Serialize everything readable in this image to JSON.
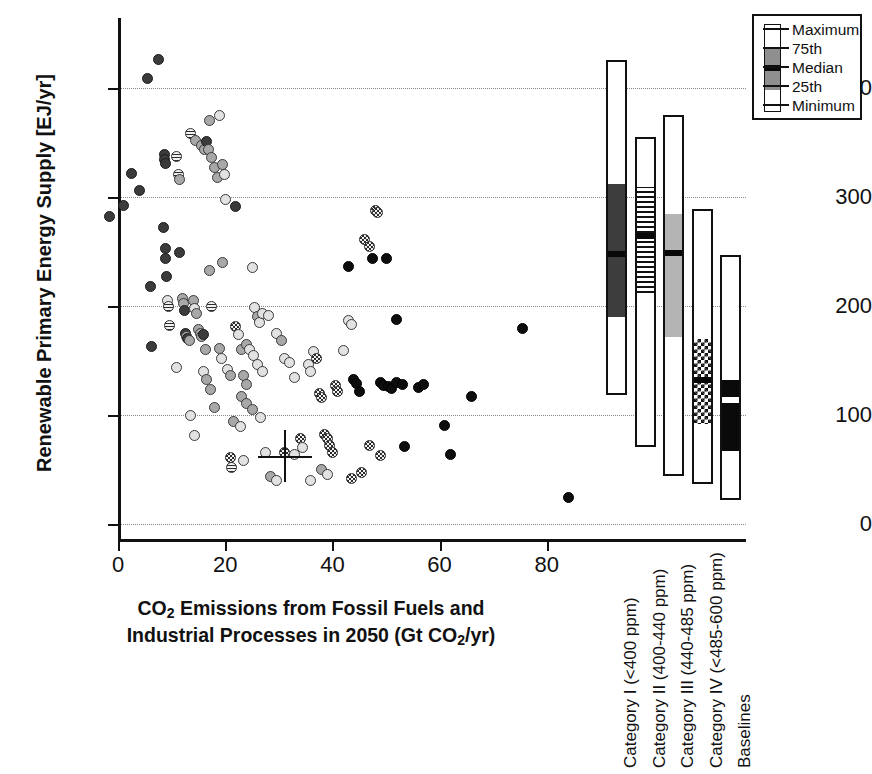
{
  "chart_data": {
    "type": "scatter",
    "title": "",
    "xlabel": "CO2 Emissions from Fossil Fuels and Industrial Processes in 2050 (Gt CO2/yr)",
    "ylabel": "Renewable Primary Energy Supply [EJ/yr]",
    "xlim": [
      -3,
      88
    ],
    "ylim": [
      -15,
      440
    ],
    "xticks": [
      0,
      20,
      40,
      60,
      80
    ],
    "yticks": [
      0,
      100,
      200,
      300,
      400
    ],
    "grid": "horizontal-dotted",
    "legend_position": "top-right",
    "points": [
      {
        "x": -1.5,
        "y": 282,
        "m": "m-dark"
      },
      {
        "x": 1.0,
        "y": 292,
        "m": "m-dark"
      },
      {
        "x": 2.5,
        "y": 322,
        "m": "m-dark"
      },
      {
        "x": 4.0,
        "y": 306,
        "m": "m-dark"
      },
      {
        "x": 5.5,
        "y": 409,
        "m": "m-dark"
      },
      {
        "x": 7.5,
        "y": 426,
        "m": "m-dark"
      },
      {
        "x": 6.0,
        "y": 218,
        "m": "m-dark"
      },
      {
        "x": 6.3,
        "y": 163,
        "m": "m-dark"
      },
      {
        "x": 8.5,
        "y": 272,
        "m": "m-dark"
      },
      {
        "x": 8.8,
        "y": 253,
        "m": "m-dark"
      },
      {
        "x": 8.9,
        "y": 244,
        "m": "m-dark"
      },
      {
        "x": 9.0,
        "y": 227,
        "m": "m-dark"
      },
      {
        "x": 9.2,
        "y": 205,
        "m": "m-light"
      },
      {
        "x": 9.4,
        "y": 200,
        "m": "m-stripe"
      },
      {
        "x": 8.6,
        "y": 339,
        "m": "m-dark"
      },
      {
        "x": 8.7,
        "y": 334,
        "m": "m-dark"
      },
      {
        "x": 8.8,
        "y": 331,
        "m": "m-dark"
      },
      {
        "x": 9.6,
        "y": 182,
        "m": "m-stripe"
      },
      {
        "x": 11.5,
        "y": 249,
        "m": "m-dark"
      },
      {
        "x": 11.0,
        "y": 337,
        "m": "m-stripe"
      },
      {
        "x": 11.2,
        "y": 321,
        "m": "m-stripe"
      },
      {
        "x": 11.4,
        "y": 316,
        "m": "m-gray"
      },
      {
        "x": 12.0,
        "y": 207,
        "m": "m-gray"
      },
      {
        "x": 12.2,
        "y": 202,
        "m": "m-gray"
      },
      {
        "x": 12.4,
        "y": 196,
        "m": "m-dark"
      },
      {
        "x": 12.6,
        "y": 175,
        "m": "m-dark"
      },
      {
        "x": 12.8,
        "y": 172,
        "m": "m-gray"
      },
      {
        "x": 13.0,
        "y": 170,
        "m": "m-dark"
      },
      {
        "x": 13.3,
        "y": 168,
        "m": "m-gray"
      },
      {
        "x": 11.0,
        "y": 144,
        "m": "m-light"
      },
      {
        "x": 13.5,
        "y": 358,
        "m": "m-stripe"
      },
      {
        "x": 14.5,
        "y": 352,
        "m": "m-gray"
      },
      {
        "x": 15.5,
        "y": 347,
        "m": "m-gray"
      },
      {
        "x": 16.2,
        "y": 344,
        "m": "m-gray"
      },
      {
        "x": 17.0,
        "y": 370,
        "m": "m-gray"
      },
      {
        "x": 16.5,
        "y": 351,
        "m": "m-dark"
      },
      {
        "x": 16.8,
        "y": 344,
        "m": "m-gray"
      },
      {
        "x": 17.5,
        "y": 336,
        "m": "m-gray"
      },
      {
        "x": 18.0,
        "y": 327,
        "m": "m-gray"
      },
      {
        "x": 18.5,
        "y": 318,
        "m": "m-gray"
      },
      {
        "x": 19.0,
        "y": 375,
        "m": "m-light"
      },
      {
        "x": 19.5,
        "y": 330,
        "m": "m-gray"
      },
      {
        "x": 19.8,
        "y": 321,
        "m": "m-light"
      },
      {
        "x": 20.0,
        "y": 298,
        "m": "m-light"
      },
      {
        "x": 22.0,
        "y": 291,
        "m": "m-dark"
      },
      {
        "x": 14.0,
        "y": 205,
        "m": "m-gray"
      },
      {
        "x": 14.3,
        "y": 198,
        "m": "m-light"
      },
      {
        "x": 14.6,
        "y": 193,
        "m": "m-gray"
      },
      {
        "x": 15.0,
        "y": 178,
        "m": "m-gray"
      },
      {
        "x": 15.3,
        "y": 175,
        "m": "m-gray"
      },
      {
        "x": 15.6,
        "y": 172,
        "m": "m-gray"
      },
      {
        "x": 16.0,
        "y": 174,
        "m": "m-dark"
      },
      {
        "x": 16.4,
        "y": 160,
        "m": "m-gray"
      },
      {
        "x": 17.0,
        "y": 233,
        "m": "m-gray"
      },
      {
        "x": 17.4,
        "y": 200,
        "m": "m-stripe"
      },
      {
        "x": 16.0,
        "y": 140,
        "m": "m-light"
      },
      {
        "x": 16.6,
        "y": 133,
        "m": "m-gray"
      },
      {
        "x": 17.2,
        "y": 123,
        "m": "m-gray"
      },
      {
        "x": 18.0,
        "y": 107,
        "m": "m-gray"
      },
      {
        "x": 13.5,
        "y": 100,
        "m": "m-light"
      },
      {
        "x": 14.2,
        "y": 81,
        "m": "m-light"
      },
      {
        "x": 19.0,
        "y": 161,
        "m": "m-gray"
      },
      {
        "x": 19.4,
        "y": 152,
        "m": "m-light"
      },
      {
        "x": 20.5,
        "y": 142,
        "m": "m-light"
      },
      {
        "x": 21.0,
        "y": 136,
        "m": "m-gray"
      },
      {
        "x": 22.0,
        "y": 181,
        "m": "m-check"
      },
      {
        "x": 22.4,
        "y": 174,
        "m": "m-light"
      },
      {
        "x": 23.0,
        "y": 160,
        "m": "m-gray"
      },
      {
        "x": 23.5,
        "y": 136,
        "m": "m-gray"
      },
      {
        "x": 24.0,
        "y": 128,
        "m": "m-gray"
      },
      {
        "x": 21.5,
        "y": 94,
        "m": "m-gray"
      },
      {
        "x": 22.8,
        "y": 89,
        "m": "m-light"
      },
      {
        "x": 19.5,
        "y": 240,
        "m": "m-gray"
      },
      {
        "x": 25.0,
        "y": 235,
        "m": "m-light"
      },
      {
        "x": 25.5,
        "y": 199,
        "m": "m-light"
      },
      {
        "x": 26.0,
        "y": 190,
        "m": "m-gray"
      },
      {
        "x": 26.4,
        "y": 185,
        "m": "m-light"
      },
      {
        "x": 27.0,
        "y": 193,
        "m": "m-light"
      },
      {
        "x": 28.0,
        "y": 191,
        "m": "m-light"
      },
      {
        "x": 24.0,
        "y": 165,
        "m": "m-gray"
      },
      {
        "x": 24.5,
        "y": 160,
        "m": "m-light"
      },
      {
        "x": 25.2,
        "y": 155,
        "m": "m-light"
      },
      {
        "x": 26.0,
        "y": 146,
        "m": "m-light"
      },
      {
        "x": 27.0,
        "y": 140,
        "m": "m-light"
      },
      {
        "x": 23.0,
        "y": 117,
        "m": "m-gray"
      },
      {
        "x": 24.0,
        "y": 111,
        "m": "m-gray"
      },
      {
        "x": 25.0,
        "y": 105,
        "m": "m-gray"
      },
      {
        "x": 26.5,
        "y": 98,
        "m": "m-light"
      },
      {
        "x": 21.0,
        "y": 61,
        "m": "m-check"
      },
      {
        "x": 21.2,
        "y": 52,
        "m": "m-stripe"
      },
      {
        "x": 23.5,
        "y": 58,
        "m": "m-light"
      },
      {
        "x": 27.5,
        "y": 66,
        "m": "m-light"
      },
      {
        "x": 28.5,
        "y": 44,
        "m": "m-gray"
      },
      {
        "x": 29.5,
        "y": 40,
        "m": "m-light"
      },
      {
        "x": 29.5,
        "y": 175,
        "m": "m-light"
      },
      {
        "x": 30.5,
        "y": 168,
        "m": "m-gray"
      },
      {
        "x": 31.0,
        "y": 152,
        "m": "m-light"
      },
      {
        "x": 32.0,
        "y": 148,
        "m": "m-light"
      },
      {
        "x": 33.0,
        "y": 134,
        "m": "m-light"
      },
      {
        "x": 31.0,
        "y": 66,
        "m": "m-check"
      },
      {
        "x": 33.0,
        "y": 64,
        "m": "m-light"
      },
      {
        "x": 34.0,
        "y": 78,
        "m": "m-check"
      },
      {
        "x": 34.5,
        "y": 70,
        "m": "m-light"
      },
      {
        "x": 35.5,
        "y": 146,
        "m": "m-light"
      },
      {
        "x": 36.0,
        "y": 140,
        "m": "m-light"
      },
      {
        "x": 36.5,
        "y": 158,
        "m": "m-light"
      },
      {
        "x": 37.0,
        "y": 152,
        "m": "m-check"
      },
      {
        "x": 37.5,
        "y": 120,
        "m": "m-check"
      },
      {
        "x": 38.0,
        "y": 116,
        "m": "m-check"
      },
      {
        "x": 38.5,
        "y": 82,
        "m": "m-check"
      },
      {
        "x": 39.0,
        "y": 78,
        "m": "m-check"
      },
      {
        "x": 39.5,
        "y": 72,
        "m": "m-check"
      },
      {
        "x": 40.0,
        "y": 66,
        "m": "m-check"
      },
      {
        "x": 38.0,
        "y": 50,
        "m": "m-gray"
      },
      {
        "x": 39.0,
        "y": 45,
        "m": "m-light"
      },
      {
        "x": 36.0,
        "y": 40,
        "m": "m-light"
      },
      {
        "x": 40.5,
        "y": 127,
        "m": "m-check"
      },
      {
        "x": 41.0,
        "y": 122,
        "m": "m-check"
      },
      {
        "x": 42.0,
        "y": 159,
        "m": "m-light"
      },
      {
        "x": 43.0,
        "y": 187,
        "m": "m-light"
      },
      {
        "x": 43.5,
        "y": 183,
        "m": "m-light"
      },
      {
        "x": 43.0,
        "y": 236,
        "m": "m-black"
      },
      {
        "x": 44.0,
        "y": 133,
        "m": "m-black"
      },
      {
        "x": 44.5,
        "y": 129,
        "m": "m-black"
      },
      {
        "x": 45.0,
        "y": 122,
        "m": "m-black"
      },
      {
        "x": 45.5,
        "y": 47,
        "m": "m-check"
      },
      {
        "x": 43.5,
        "y": 42,
        "m": "m-check"
      },
      {
        "x": 46.0,
        "y": 261,
        "m": "m-check"
      },
      {
        "x": 47.0,
        "y": 255,
        "m": "m-check"
      },
      {
        "x": 48.0,
        "y": 288,
        "m": "m-check"
      },
      {
        "x": 48.5,
        "y": 286,
        "m": "m-check"
      },
      {
        "x": 47.5,
        "y": 244,
        "m": "m-black"
      },
      {
        "x": 50.0,
        "y": 244,
        "m": "m-black"
      },
      {
        "x": 49.0,
        "y": 130,
        "m": "m-black"
      },
      {
        "x": 49.5,
        "y": 127,
        "m": "m-black"
      },
      {
        "x": 50.5,
        "y": 126,
        "m": "m-black"
      },
      {
        "x": 51.0,
        "y": 124,
        "m": "m-black"
      },
      {
        "x": 52.0,
        "y": 130,
        "m": "m-black"
      },
      {
        "x": 53.0,
        "y": 128,
        "m": "m-black"
      },
      {
        "x": 47.0,
        "y": 72,
        "m": "m-check"
      },
      {
        "x": 49.0,
        "y": 63,
        "m": "m-check"
      },
      {
        "x": 52.0,
        "y": 188,
        "m": "m-black"
      },
      {
        "x": 53.5,
        "y": 71,
        "m": "m-black"
      },
      {
        "x": 56.0,
        "y": 125,
        "m": "m-black"
      },
      {
        "x": 57.0,
        "y": 128,
        "m": "m-black"
      },
      {
        "x": 61.0,
        "y": 90,
        "m": "m-black"
      },
      {
        "x": 62.0,
        "y": 64,
        "m": "m-black"
      },
      {
        "x": 66.0,
        "y": 117,
        "m": "m-black"
      },
      {
        "x": 75.5,
        "y": 179,
        "m": "m-black"
      },
      {
        "x": 84.0,
        "y": 24,
        "m": "m-black"
      }
    ],
    "crosshair": {
      "x": 31,
      "y": 62
    },
    "marker_styles": {
      "m-dark": "dark-gray-filled-circle",
      "m-black": "black-filled-circle",
      "m-gray": "medium-gray-circle",
      "m-light": "light-gray-circle",
      "m-stripe": "horizontally-striped-circle",
      "m-check": "checkered-circle"
    },
    "boxplots": [
      {
        "label": "Category I (<400 ppm)",
        "min": 118,
        "q25": 190,
        "median": 248,
        "q75": 312,
        "max": 426,
        "fill": "seg-solid-dark",
        "median_style": "seg-median-black"
      },
      {
        "label": "Category II (400-440 ppm)",
        "min": 71,
        "q25": 212,
        "median": 264,
        "q75": 309,
        "max": 355,
        "fill": "seg-stripe",
        "median_style": "seg-median-black"
      },
      {
        "label": "Category III (440-485 ppm)",
        "min": 44,
        "q25": 172,
        "median": 249,
        "q75": 284,
        "max": 375,
        "fill": "seg-solid-gray",
        "median_style": "seg-median-black"
      },
      {
        "label": "Category IV (<485-600 ppm)",
        "min": 37,
        "q25": 92,
        "median": 132,
        "q75": 170,
        "max": 289,
        "fill": "seg-check",
        "median_style": "seg-median-black"
      },
      {
        "label": "Baselines",
        "min": 22,
        "q25": 67,
        "median": 114,
        "q75": 132,
        "max": 247,
        "fill": "seg-solid-black",
        "median_style": "seg-median-white"
      }
    ]
  },
  "legend": {
    "title": "",
    "rows": [
      {
        "label": "Maximum"
      },
      {
        "label": "75th"
      },
      {
        "label": "Median"
      },
      {
        "label": "25th"
      },
      {
        "label": "Minimum"
      }
    ]
  },
  "axes": {
    "y_title_main": "Renewable Primary Energy Supply [EJ/yr]",
    "x_title_line1_a": "CO",
    "x_title_line1_sub": "2",
    "x_title_line1_b": " Emissions from Fossil Fuels and",
    "x_title_line2_a": "Industrial Processes in 2050 (Gt CO",
    "x_title_line2_sub": "2",
    "x_title_line2_b": "/yr)"
  },
  "colors": {
    "axis": "#111111",
    "grid": "#8a8a8a",
    "marker_dark": "#3b3b3b",
    "marker_black": "#0d0d0d",
    "marker_gray": "#a8a8a8",
    "marker_light": "#e2e2e2",
    "box_dark": "#3d3d3d",
    "box_gray": "#b4b4b4",
    "box_black": "#0a0a0a"
  }
}
